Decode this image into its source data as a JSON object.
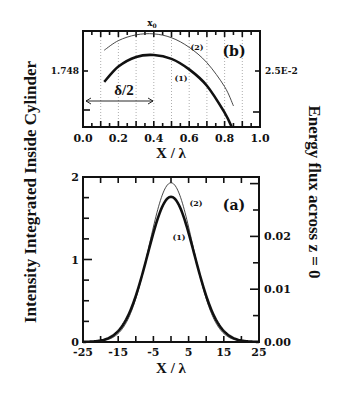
{
  "chart_data": [
    {
      "id": "panel-b",
      "type": "line",
      "panel_label": "(b)",
      "title": "",
      "xlabel": "X / λ",
      "ylabel": "Intensity Integrated Inside Cylinder",
      "ylabel_right": "Energy flux across z = 0",
      "xlim": [
        0.0,
        1.0
      ],
      "x_ticks": [
        "0.0",
        "0.2",
        "0.4",
        "0.6",
        "0.8",
        "1.0"
      ],
      "y_tick_left": "1.748",
      "y_tick_right": "2.5E-2",
      "grid": "vertical dotted lines every 0.1",
      "annotations": [
        {
          "text": "x0",
          "x": 0.4,
          "position": "top"
        },
        {
          "text": "δ/2",
          "type": "double-arrow",
          "from_x": 0.0,
          "to_x": 0.4
        }
      ],
      "series": [
        {
          "name": "(1)",
          "style": "thick",
          "x": [
            0.12,
            0.2,
            0.3,
            0.4,
            0.5,
            0.6,
            0.7,
            0.8,
            0.84
          ],
          "y_px_rel": [
            0.53,
            0.37,
            0.27,
            0.25,
            0.29,
            0.4,
            0.57,
            0.85,
            1.0
          ]
        },
        {
          "name": "(2)",
          "style": "thin",
          "x": [
            0.12,
            0.2,
            0.3,
            0.4,
            0.5,
            0.6,
            0.7,
            0.8,
            0.85
          ],
          "y_px_rel": [
            0.2,
            0.1,
            0.04,
            0.03,
            0.07,
            0.17,
            0.33,
            0.58,
            0.78
          ]
        }
      ]
    },
    {
      "id": "panel-a",
      "type": "line",
      "panel_label": "(a)",
      "title": "",
      "xlabel": "X / λ",
      "ylabel": "Intensity Integrated Inside Cylinder",
      "ylabel_right": "Energy flux across z = 0",
      "xlim": [
        -25,
        25
      ],
      "ylim": [
        0,
        2
      ],
      "ylim_right": [
        0.0,
        0.03125
      ],
      "x_ticks": [
        "-25",
        "-15",
        "-5",
        "5",
        "15",
        "25"
      ],
      "y_ticks_left": [
        "0",
        "1",
        "2"
      ],
      "y_ticks_right": [
        "0.00",
        "0.01",
        "0.02"
      ],
      "grid": false,
      "series": [
        {
          "name": "(1)",
          "style": "thick",
          "shape": "gaussian",
          "peak": 1.76,
          "center": 0.0,
          "sigma": 6.6
        },
        {
          "name": "(2)",
          "style": "thin",
          "shape": "gaussian",
          "peak": 1.93,
          "center": 0.0,
          "sigma": 6.2
        }
      ]
    }
  ],
  "labels": {
    "left_title": "Intensity Integrated Inside Cylinder",
    "right_title": "Energy flux across z = 0",
    "top_xlabel": "X / λ",
    "bottom_xlabel": "X / λ",
    "x0": "x",
    "x0_sub": "0",
    "delta_half": "δ/2",
    "panel_b": "(b)",
    "panel_a": "(a)",
    "curve1": "(1)",
    "curve2": "(2)",
    "top_y_left": "1.748",
    "top_y_right": "2.5E-2"
  },
  "ticks": {
    "top_x": [
      "0.0",
      "0.2",
      "0.4",
      "0.6",
      "0.8",
      "1.0"
    ],
    "bottom_x": [
      "-25",
      "-15",
      "-5",
      "5",
      "15",
      "25"
    ],
    "bottom_y_left": [
      "0",
      "1",
      "2"
    ],
    "bottom_y_right": [
      "0.00",
      "0.01",
      "0.02"
    ]
  }
}
